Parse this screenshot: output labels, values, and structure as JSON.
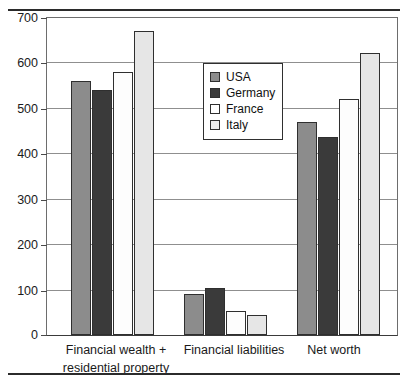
{
  "chart_data": {
    "type": "bar",
    "title": "",
    "subtitle": "",
    "xlabel": "",
    "ylabel": "",
    "ylim": [
      0,
      700
    ],
    "ytick_step": 100,
    "yticks": [
      0,
      100,
      200,
      300,
      400,
      500,
      600,
      700
    ],
    "ytick_labels": [
      "0",
      "100",
      "200",
      "300",
      "400",
      "500",
      "600",
      "700"
    ],
    "grid": true,
    "grid_axis": "y",
    "legend_position": "inside-center-top",
    "categories": [
      "Financial wealth + residential property",
      "Financial liabilities",
      "Net worth"
    ],
    "category_lines": [
      [
        "Financial wealth +",
        "residential property"
      ],
      [
        "Financial liabilities"
      ],
      [
        "Net worth"
      ]
    ],
    "series": [
      {
        "name": "USA",
        "color": "#8c8c8c",
        "values": [
          560,
          90,
          470
        ]
      },
      {
        "name": "Germany",
        "color": "#3a3a3a",
        "values": [
          540,
          103,
          435
        ]
      },
      {
        "name": "France",
        "color": "#fdfdfd",
        "values": [
          580,
          52,
          520
        ]
      },
      {
        "name": "Italy",
        "color": "#e6e6e6",
        "values": [
          670,
          43,
          620
        ]
      }
    ]
  },
  "legend": {
    "items": [
      {
        "label": "USA"
      },
      {
        "label": "Germany"
      },
      {
        "label": "France"
      },
      {
        "label": "Italy"
      }
    ]
  },
  "axis": {
    "y_labels": [
      "700",
      "600",
      "500",
      "400",
      "300",
      "200",
      "100",
      "0"
    ]
  },
  "categories": {
    "c0_line0": "Financial wealth +",
    "c0_line1": "residential property",
    "c1_line0": "Financial liabilities",
    "c2_line0": "Net worth"
  }
}
